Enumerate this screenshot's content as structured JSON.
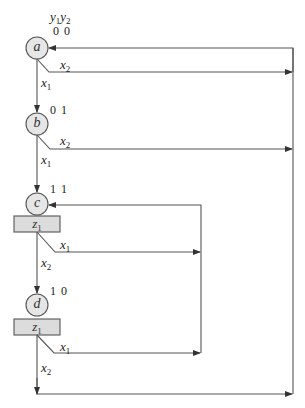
{
  "header": {
    "var_y": "y",
    "y1_sub": "1",
    "y2_sub": "2"
  },
  "states": [
    {
      "name": "a",
      "code": "0 0"
    },
    {
      "name": "b",
      "code": "0 1"
    },
    {
      "name": "c",
      "code": "1 1",
      "output": {
        "var": "z",
        "sub": "1"
      }
    },
    {
      "name": "d",
      "code": "1 0",
      "output": {
        "var": "z",
        "sub": "1"
      }
    }
  ],
  "transitions": [
    {
      "from": "a",
      "to": "b",
      "cond_var": "x",
      "cond_sub": "1"
    },
    {
      "from": "a",
      "to": "a",
      "cond_var": "x",
      "cond_sub": "2"
    },
    {
      "from": "b",
      "to": "c",
      "cond_var": "x",
      "cond_sub": "1"
    },
    {
      "from": "b",
      "to": "a",
      "cond_var": "x",
      "cond_sub": "2"
    },
    {
      "from": "c",
      "to": "c",
      "cond_var": "x",
      "cond_sub": "1"
    },
    {
      "from": "c",
      "to": "d",
      "cond_var": "x",
      "cond_sub": "2"
    },
    {
      "from": "d",
      "to": "c",
      "cond_var": "x",
      "cond_sub": "1"
    },
    {
      "from": "d",
      "to": "a",
      "cond_var": "x",
      "cond_sub": "2"
    }
  ],
  "colors": {
    "line": "#555555",
    "state_fill": "#e6e6e6",
    "output_fill": "#dcdcdc"
  }
}
